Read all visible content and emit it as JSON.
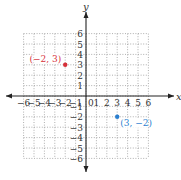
{
  "chart_data": {
    "type": "scatter",
    "title": "",
    "xlabel": "x",
    "ylabel": "y",
    "xlim": [
      -6,
      6
    ],
    "ylim": [
      -6,
      6
    ],
    "grid": true,
    "grid_style": "dotted",
    "x_ticks": [
      -6,
      -5,
      -4,
      -3,
      -2,
      -1,
      1,
      2,
      3,
      4,
      5,
      6
    ],
    "y_ticks": [
      -6,
      -5,
      -4,
      -3,
      -2,
      -1,
      1,
      2,
      3,
      4,
      5,
      6
    ],
    "origin_label": "0",
    "series": [
      {
        "name": "(−2, 3)",
        "x": -2,
        "y": 3,
        "color": "#d6313a",
        "label": "(−2, 3)"
      },
      {
        "name": "(3, −2)",
        "x": 3,
        "y": -2,
        "color": "#2a7fd0",
        "label": "(3, −2)"
      }
    ]
  },
  "axes": {
    "x_label": "x",
    "y_label": "y",
    "origin": "0",
    "x_tick_labels": [
      "−6",
      "−5",
      "−4",
      "−3",
      "−2",
      "−1",
      "1",
      "2",
      "3",
      "4",
      "5",
      "6"
    ],
    "y_tick_labels": [
      "6",
      "5",
      "4",
      "3",
      "2",
      "1",
      "−1",
      "−2",
      "−3",
      "−4",
      "−5",
      "−6"
    ]
  },
  "points": [
    {
      "label": "(−2, 3)",
      "color": "#d6313a"
    },
    {
      "label": "(3, −2)",
      "color": "#2a7fd0"
    }
  ],
  "colors": {
    "axis": "#222222",
    "grid": "#9a9a9a",
    "text": "#333333"
  }
}
